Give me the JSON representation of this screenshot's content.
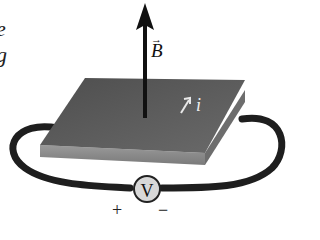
{
  "figure": {
    "left_text_fragments": [
      "e",
      "g"
    ],
    "field_label": "B",
    "field_vector_marker": "→",
    "current_label": "i",
    "current_arrow": "↗",
    "voltmeter_label": "V",
    "plus_sign": "+",
    "minus_sign": "−"
  },
  "colors": {
    "slab_top": "#5a5a5a",
    "slab_side": "#8a8a8a",
    "wire": "#1e1e1e",
    "arrow": "#111111",
    "voltmeter_fill": "#d8d8d8"
  }
}
